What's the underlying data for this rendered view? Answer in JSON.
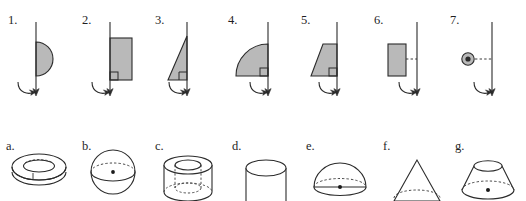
{
  "figure": {
    "faint_header_text": "",
    "background_color": "#ffffff",
    "stroke_color": "#2b2b2b",
    "fill_color": "#b9b9b9",
    "dash_color": "#3a3a3a"
  },
  "top_row": {
    "caption": "",
    "items": [
      {
        "label": "1.",
        "shape_name": "semicircle-right-of-axis",
        "description": "Shaded half disc with its flat diameter edge lying on the vertical rotation axis, bulging to the right.",
        "axis": "vertical line with curved arrow at the bottom indicating rotation",
        "attached_to_axis": true,
        "right_angle_marker": false
      },
      {
        "label": "2.",
        "shape_name": "rectangle-on-axis",
        "description": "Shaded rectangle with its left edge on the vertical rotation axis.",
        "axis": "vertical line with curved arrow at the bottom indicating rotation",
        "attached_to_axis": true,
        "right_angle_marker": true
      },
      {
        "label": "3.",
        "shape_name": "right-triangle-on-axis",
        "description": "Shaded right triangle with vertical leg on the axis and apex at the top, horizontal leg at the bottom.",
        "axis": "vertical line with curved arrow at the bottom indicating rotation",
        "attached_to_axis": true,
        "right_angle_marker": true
      },
      {
        "label": "4.",
        "shape_name": "quarter-circle-left-of-axis",
        "description": "Shaded quarter disc to the left of the axis with the vertical radius on the axis.",
        "axis": "vertical line with curved arrow at the bottom indicating rotation",
        "attached_to_axis": true,
        "right_angle_marker": true
      },
      {
        "label": "5.",
        "shape_name": "trapezoid-left-of-axis",
        "description": "Shaded right trapezoid to the left of the axis with its vertical side on the axis and slanted left side.",
        "axis": "vertical line with curved arrow at the bottom indicating rotation",
        "attached_to_axis": true,
        "right_angle_marker": true
      },
      {
        "label": "6.",
        "shape_name": "rectangle-offset-from-axis",
        "description": "Shaded rectangle set apart from the axis, joined by a short horizontal dashed segment.",
        "axis": "vertical line with curved arrow at the bottom indicating rotation",
        "attached_to_axis": false,
        "right_angle_marker": false
      },
      {
        "label": "7.",
        "shape_name": "small-disc-offset-from-axis",
        "description": "Small shaded circle set apart from the axis, joined by a short horizontal dashed segment.",
        "axis": "vertical line with curved arrow at the bottom indicating rotation",
        "attached_to_axis": false,
        "right_angle_marker": false
      }
    ]
  },
  "bottom_row": {
    "caption": "",
    "items": [
      {
        "label": "a.",
        "shape_name": "torus",
        "description": "Ring-shaped torus drawn in outline with a dashed hidden inner curve."
      },
      {
        "label": "b.",
        "shape_name": "sphere",
        "description": "Sphere outline with dashed equator ellipse and a solid centre dot."
      },
      {
        "label": "c.",
        "shape_name": "hollow-cylinder",
        "description": "Cylinder with a cylindrical hole bored through; inner ellipse on top and dashed hidden bottom ellipses."
      },
      {
        "label": "d.",
        "shape_name": "cylinder",
        "description": "Solid cylinder with an elliptical top face."
      },
      {
        "label": "e.",
        "shape_name": "hemisphere",
        "description": "Dome / hemisphere with a dashed base ellipse and a solid centre dot."
      },
      {
        "label": "f.",
        "shape_name": "cone",
        "description": "Cone with apex at the top and a dashed hidden base ellipse."
      },
      {
        "label": "g.",
        "shape_name": "truncated-cone",
        "description": "Frustum / truncated cone with an elliptical top face, dashed base ellipse and a solid centre dot."
      }
    ]
  }
}
